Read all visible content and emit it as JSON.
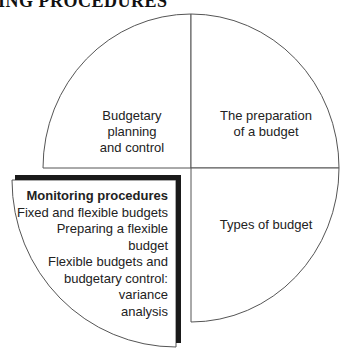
{
  "header": {
    "title": "MONITORING PROCEDURES",
    "visible_fragment": "ORING PROCEDURES"
  },
  "diagram": {
    "type": "quadrant-circle",
    "stroke_color": "#555555",
    "highlight_border_color": "#1a1a1a",
    "quadrants": {
      "top_left": {
        "lines": [
          "Budgetary",
          "planning",
          "and control"
        ]
      },
      "top_right": {
        "lines": [
          "The preparation",
          "of a budget"
        ]
      },
      "bottom_right": {
        "lines": [
          "Types of budget"
        ]
      },
      "bottom_left": {
        "highlighted": true,
        "title": "Monitoring procedures",
        "lines": [
          "Fixed and flexible budgets",
          "Preparing a flexible",
          "budget",
          "Flexible budgets and",
          "budgetary control:",
          "variance",
          "analysis"
        ]
      }
    }
  }
}
